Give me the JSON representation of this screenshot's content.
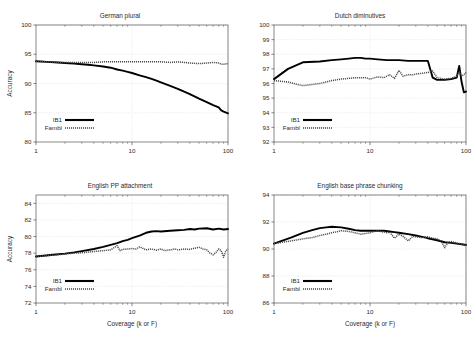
{
  "figure": {
    "background": "#ffffff",
    "series_colors": {
      "ib1": "#000000",
      "fambl": "#4a4a4a"
    },
    "axis_title_x": "Coverage (k or F)",
    "axis_title_y": "Accuracy",
    "legend": {
      "ib1": "IB1",
      "fambl": "Fambl"
    }
  },
  "chart_data": [
    {
      "id": "german-plural",
      "type": "line",
      "title": "German plural",
      "xlabel": "",
      "ylabel": "Accuracy",
      "xscale": "log",
      "xlim": [
        1,
        100
      ],
      "ylim": [
        80,
        100
      ],
      "yticks": [
        80,
        85,
        90,
        95,
        100
      ],
      "xticks": [
        1,
        10,
        100
      ],
      "grid": true,
      "legend_position": "bottom-left",
      "series": [
        {
          "name": "IB1",
          "x": [
            1,
            1.3,
            1.7,
            2,
            2.5,
            3,
            3.5,
            4,
            5,
            6,
            7,
            8,
            9,
            10,
            12,
            14,
            16,
            18,
            20,
            25,
            30,
            35,
            40,
            50,
            60,
            70,
            80,
            85,
            90,
            100
          ],
          "values": [
            93.8,
            93.7,
            93.6,
            93.5,
            93.4,
            93.3,
            93.2,
            93.1,
            92.9,
            92.7,
            92.4,
            92.2,
            92.0,
            91.8,
            91.4,
            91.1,
            90.8,
            90.5,
            90.2,
            89.6,
            89.1,
            88.6,
            88.2,
            87.4,
            86.8,
            86.3,
            85.9,
            85.4,
            85.2,
            84.9
          ]
        },
        {
          "name": "Fambl",
          "x": [
            1,
            1.3,
            1.7,
            2,
            2.5,
            3,
            3.5,
            4,
            5,
            6,
            7,
            8,
            9,
            10,
            12,
            14,
            16,
            18,
            20,
            25,
            30,
            35,
            40,
            50,
            60,
            70,
            80,
            85,
            90,
            100
          ],
          "values": [
            93.8,
            93.7,
            93.6,
            93.6,
            93.6,
            93.6,
            93.6,
            93.6,
            93.7,
            93.7,
            93.7,
            93.7,
            93.7,
            93.7,
            93.7,
            93.7,
            93.7,
            93.7,
            93.7,
            93.6,
            93.7,
            93.6,
            93.5,
            93.4,
            93.5,
            93.6,
            93.5,
            93.3,
            93.3,
            93.4
          ]
        }
      ]
    },
    {
      "id": "dutch-diminutives",
      "type": "line",
      "title": "Dutch diminutives",
      "xlabel": "",
      "ylabel": "",
      "xscale": "log",
      "xlim": [
        1,
        100
      ],
      "ylim": [
        92,
        100
      ],
      "yticks": [
        92,
        93,
        94,
        95,
        96,
        97,
        98,
        99,
        100
      ],
      "xticks": [
        1,
        10,
        100
      ],
      "grid": true,
      "legend_position": "bottom-left",
      "series": [
        {
          "name": "IB1",
          "x": [
            1,
            1.4,
            2,
            3,
            4,
            5,
            6,
            7,
            8,
            9,
            10,
            12,
            15,
            20,
            25,
            30,
            35,
            40,
            45,
            50,
            60,
            70,
            80,
            85,
            90,
            95,
            100
          ],
          "values": [
            96.3,
            97.0,
            97.45,
            97.5,
            97.6,
            97.65,
            97.7,
            97.75,
            97.75,
            97.7,
            97.7,
            97.65,
            97.6,
            97.6,
            97.55,
            97.55,
            97.55,
            97.55,
            96.4,
            96.25,
            96.25,
            96.3,
            96.4,
            97.2,
            96.1,
            95.4,
            95.45
          ]
        },
        {
          "name": "Fambl",
          "x": [
            1,
            1.4,
            2,
            3,
            4,
            5,
            6,
            7,
            8,
            9,
            10,
            12,
            14,
            16,
            18,
            20,
            22,
            25,
            28,
            30,
            35,
            40,
            45,
            50,
            60,
            70,
            80,
            85,
            90,
            95,
            100
          ],
          "values": [
            96.2,
            96.1,
            95.85,
            96.0,
            96.2,
            96.3,
            96.35,
            96.4,
            96.4,
            96.4,
            96.3,
            96.45,
            96.4,
            96.6,
            96.35,
            96.9,
            96.5,
            96.6,
            96.6,
            96.65,
            96.7,
            96.75,
            96.85,
            96.4,
            96.3,
            96.35,
            96.5,
            96.8,
            96.5,
            96.6,
            96.75
          ]
        }
      ]
    },
    {
      "id": "english-pp-attachment",
      "type": "line",
      "title": "English PP attachment",
      "xlabel": "Coverage (k or F)",
      "ylabel": "Accuracy",
      "xscale": "log",
      "xlim": [
        1,
        100
      ],
      "ylim": [
        72,
        85
      ],
      "yticks": [
        72,
        74,
        76,
        78,
        80,
        82,
        84
      ],
      "xticks": [
        1,
        10,
        100
      ],
      "grid": true,
      "legend_position": "bottom-left",
      "series": [
        {
          "name": "IB1",
          "x": [
            1,
            1.5,
            2,
            2.5,
            3,
            4,
            5,
            6,
            7,
            8,
            9,
            10,
            12,
            14,
            16,
            18,
            20,
            25,
            30,
            35,
            40,
            45,
            50,
            60,
            70,
            80,
            90,
            100
          ],
          "values": [
            77.6,
            77.8,
            77.95,
            78.1,
            78.25,
            78.5,
            78.75,
            79.0,
            79.2,
            79.45,
            79.6,
            79.8,
            80.1,
            80.45,
            80.6,
            80.65,
            80.6,
            80.7,
            80.75,
            80.8,
            80.9,
            80.85,
            80.95,
            81.0,
            80.85,
            80.95,
            80.85,
            80.9
          ]
        },
        {
          "name": "Fambl",
          "x": [
            1,
            1.5,
            2,
            2.5,
            3,
            4,
            5,
            6,
            7,
            7.5,
            8,
            9,
            10,
            11,
            12,
            14,
            16,
            18,
            20,
            22,
            25,
            28,
            30,
            35,
            40,
            45,
            50,
            55,
            60,
            65,
            70,
            75,
            80,
            85,
            90,
            95,
            100
          ],
          "values": [
            77.6,
            77.75,
            77.9,
            78.0,
            78.05,
            78.2,
            78.3,
            78.4,
            78.9,
            78.3,
            78.45,
            78.5,
            78.55,
            78.5,
            78.75,
            78.4,
            78.5,
            78.35,
            78.5,
            78.3,
            78.4,
            78.5,
            78.4,
            78.5,
            78.45,
            78.6,
            78.7,
            78.5,
            78.4,
            78.0,
            77.8,
            78.1,
            78.5,
            78.3,
            77.5,
            78.3,
            78.5
          ]
        }
      ]
    },
    {
      "id": "english-base-phrase-chunking",
      "type": "line",
      "title": "English base phrase chunking",
      "xlabel": "Coverage (k or F)",
      "ylabel": "",
      "xscale": "log",
      "xlim": [
        1,
        100
      ],
      "ylim": [
        86,
        94
      ],
      "yticks": [
        86,
        88,
        90,
        92,
        94
      ],
      "xticks": [
        1,
        10,
        100
      ],
      "grid": true,
      "legend_position": "bottom-left",
      "series": [
        {
          "name": "IB1",
          "x": [
            1,
            1.5,
            2,
            2.5,
            3,
            3.5,
            4,
            5,
            6,
            7,
            8,
            9,
            10,
            12,
            14,
            16,
            18,
            20,
            25,
            30,
            35,
            40,
            50,
            60,
            70,
            80,
            90,
            100
          ],
          "values": [
            90.4,
            90.85,
            91.2,
            91.4,
            91.55,
            91.6,
            91.65,
            91.6,
            91.5,
            91.4,
            91.35,
            91.35,
            91.35,
            91.35,
            91.35,
            91.3,
            91.25,
            91.2,
            91.1,
            91.0,
            90.9,
            90.8,
            90.65,
            90.5,
            90.45,
            90.4,
            90.35,
            90.3
          ]
        },
        {
          "name": "Fambl",
          "x": [
            1,
            1.5,
            2,
            2.5,
            3,
            3.5,
            4,
            5,
            6,
            7,
            8,
            9,
            10,
            11,
            12,
            13,
            14,
            15,
            16,
            18,
            20,
            22,
            25,
            28,
            30,
            35,
            40,
            45,
            50,
            55,
            60,
            65,
            70,
            80,
            90,
            100
          ],
          "values": [
            90.4,
            90.6,
            90.75,
            90.85,
            91.0,
            91.1,
            91.2,
            91.35,
            91.3,
            91.2,
            91.1,
            91.15,
            91.2,
            91.3,
            91.35,
            91.3,
            91.25,
            91.2,
            91.25,
            90.8,
            91.1,
            90.95,
            90.6,
            90.95,
            90.9,
            90.85,
            90.9,
            90.8,
            90.75,
            90.6,
            90.1,
            90.5,
            90.55,
            90.45,
            90.35,
            90.3
          ]
        }
      ]
    }
  ]
}
